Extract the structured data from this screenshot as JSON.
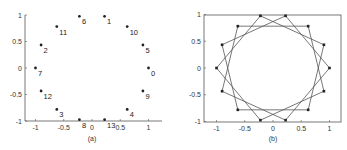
{
  "chart_data": [
    {
      "id": "a",
      "type": "scatter",
      "caption": "(a)",
      "title": "",
      "xlabel": "",
      "ylabel": "",
      "xlim": [
        -1.2,
        1.2
      ],
      "ylim": [
        -1,
        1
      ],
      "xticks": [
        "-1",
        "-0.5",
        "0",
        "0.5",
        "1"
      ],
      "xtick_values": [
        -1,
        -0.5,
        0,
        0.5,
        1
      ],
      "yticks": [
        "-1",
        "-0.5",
        "0",
        "0.5",
        "1"
      ],
      "ytick_values": [
        -1,
        -0.5,
        0,
        0.5,
        1
      ],
      "grid": false,
      "frame": "left-bottom",
      "description": "14 points on the unit circle; label n placed at angle n*3*2pi/14",
      "points": [
        {
          "label": "0",
          "x": 1.0,
          "y": 0.0
        },
        {
          "label": "1",
          "x": 0.223,
          "y": 0.975
        },
        {
          "label": "2",
          "x": -0.901,
          "y": 0.434
        },
        {
          "label": "3",
          "x": -0.623,
          "y": -0.782
        },
        {
          "label": "4",
          "x": 0.623,
          "y": -0.782
        },
        {
          "label": "5",
          "x": 0.901,
          "y": 0.434
        },
        {
          "label": "6",
          "x": -0.223,
          "y": 0.975
        },
        {
          "label": "7",
          "x": -1.0,
          "y": 0.0
        },
        {
          "label": "8",
          "x": -0.223,
          "y": -0.975
        },
        {
          "label": "9",
          "x": 0.901,
          "y": -0.434
        },
        {
          "label": "10",
          "x": 0.623,
          "y": 0.782
        },
        {
          "label": "11",
          "x": -0.623,
          "y": 0.782
        },
        {
          "label": "12",
          "x": -0.901,
          "y": -0.434
        },
        {
          "label": "13",
          "x": 0.223,
          "y": -0.975
        }
      ]
    },
    {
      "id": "b",
      "type": "line",
      "caption": "(b)",
      "title": "",
      "xlabel": "",
      "ylabel": "",
      "xlim": [
        -1.2,
        1.2
      ],
      "ylim": [
        -1,
        1
      ],
      "xticks": [
        "-1",
        "-0.5",
        "0",
        "0.5",
        "1"
      ],
      "xtick_values": [
        -1,
        -0.5,
        0,
        0.5,
        1
      ],
      "yticks": [
        "-1",
        "-0.5",
        "0",
        "0.5",
        "1"
      ],
      "ytick_values": [
        -1,
        -0.5,
        0,
        0.5,
        1
      ],
      "grid": false,
      "frame": "box",
      "description": "Star polygon {14/3}: 14 points on the unit circle, each joined to the vertex three steps ahead",
      "n_points": 14,
      "step": 3,
      "points": [
        {
          "x": 1.0,
          "y": 0.0
        },
        {
          "x": 0.901,
          "y": 0.434
        },
        {
          "x": 0.623,
          "y": 0.782
        },
        {
          "x": 0.223,
          "y": 0.975
        },
        {
          "x": -0.223,
          "y": 0.975
        },
        {
          "x": -0.623,
          "y": 0.782
        },
        {
          "x": -0.901,
          "y": 0.434
        },
        {
          "x": -1.0,
          "y": 0.0
        },
        {
          "x": -0.901,
          "y": -0.434
        },
        {
          "x": -0.623,
          "y": -0.782
        },
        {
          "x": -0.223,
          "y": -0.975
        },
        {
          "x": 0.223,
          "y": -0.975
        },
        {
          "x": 0.623,
          "y": -0.782
        },
        {
          "x": 0.901,
          "y": -0.434
        }
      ]
    }
  ]
}
